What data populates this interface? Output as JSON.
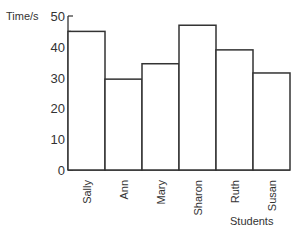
{
  "chart_data": {
    "type": "bar",
    "title": "",
    "xlabel": "Students",
    "ylabel": "Time/s",
    "categories": [
      "Sally",
      "Ann",
      "Mary",
      "Sharon",
      "Ruth",
      "Susan"
    ],
    "values": [
      45,
      29.5,
      34.5,
      47,
      39,
      31.5
    ],
    "ylim": [
      0,
      50
    ],
    "yticks_major": [
      0,
      10,
      20,
      30,
      40,
      50
    ],
    "yticks_minor_step": 5,
    "grid": false,
    "legend": null,
    "bar_style": {
      "fill": "#ffffff",
      "stroke": "#333333"
    }
  }
}
